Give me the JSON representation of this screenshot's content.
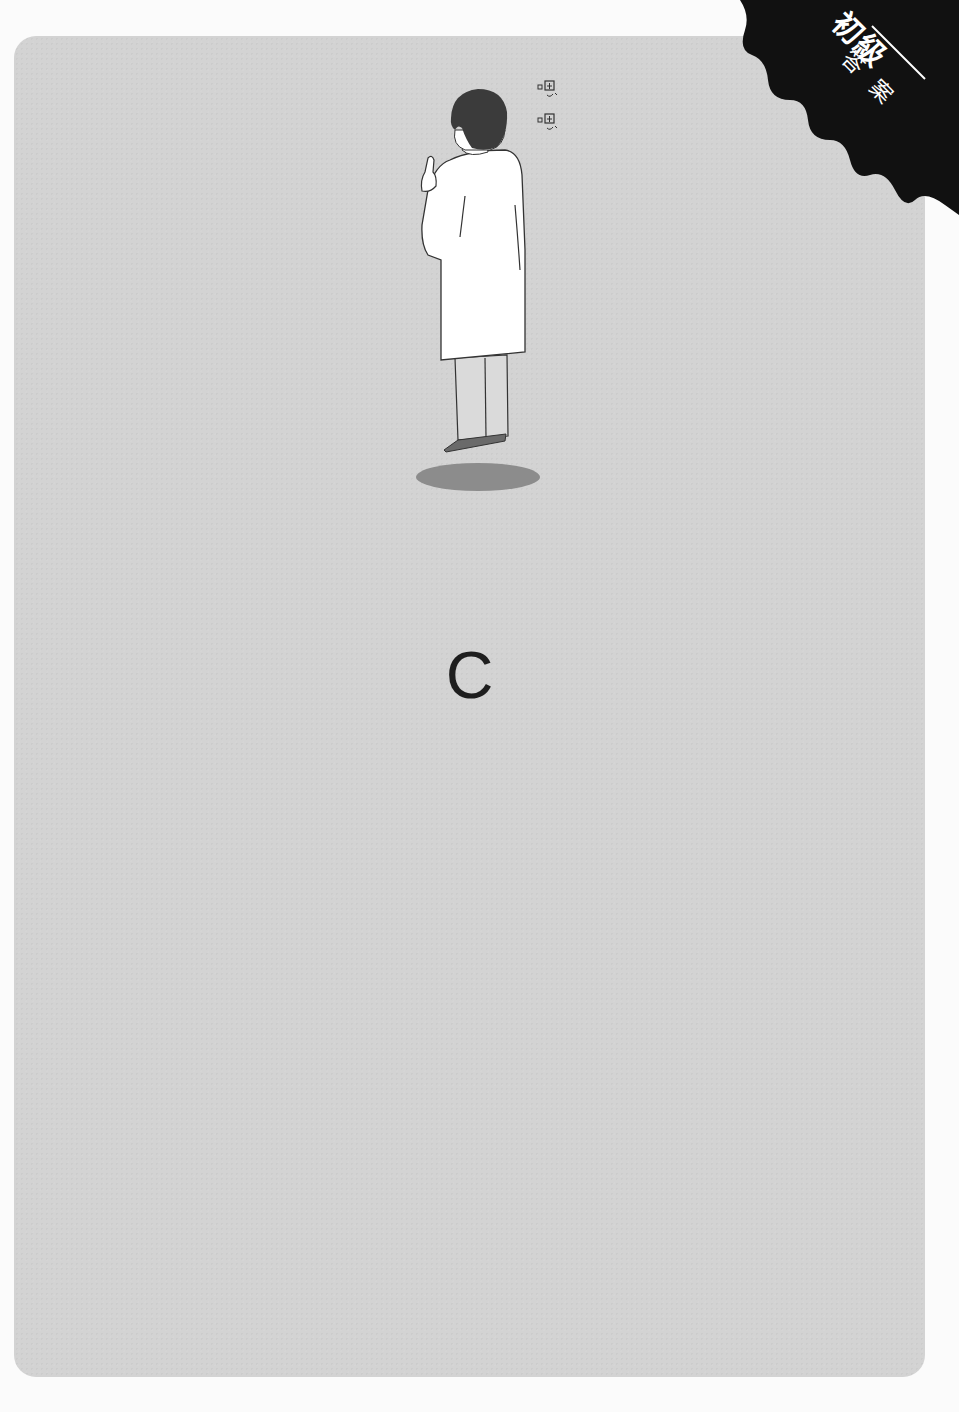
{
  "page": {
    "background_color": "#fbfbfb",
    "card_color": "#d3d3d3"
  },
  "corner_badge": {
    "level": "初級",
    "label": "答案",
    "background_color": "#111111",
    "text_color": "#ffffff"
  },
  "illustration": {
    "subject": "man in white lab coat seen from behind, raising index finger, floating above shadow",
    "thought_text": [
      "嗯",
      "嗯"
    ],
    "colors": {
      "hair": "#3a3a3a",
      "coat": "#ffffff",
      "pants": "#d9d9d9",
      "shoes": "#666666",
      "shadow": "#8c8c8c",
      "outline": "#333333"
    }
  },
  "answer": {
    "letter": "C"
  }
}
